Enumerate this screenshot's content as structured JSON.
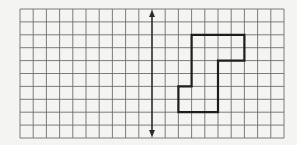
{
  "figure": {
    "background_color": "#f4f4f2",
    "grid": {
      "columns": 20,
      "rows": 10,
      "origin_x": 20,
      "origin_y": 9,
      "cell_width": 13.2,
      "cell_height": 12.9,
      "line_color": "#6e6e6e"
    },
    "reflection_line": {
      "type": "vertical double-headed arrow",
      "column": 10,
      "color": "#2a2a2a"
    },
    "shape": {
      "stroke_color": "#1e1e1e",
      "vertices": [
        [
          13,
          2
        ],
        [
          17,
          2
        ],
        [
          17,
          4
        ],
        [
          15,
          4
        ],
        [
          15,
          8
        ],
        [
          12,
          8
        ],
        [
          12,
          6
        ],
        [
          13,
          6
        ]
      ]
    }
  }
}
